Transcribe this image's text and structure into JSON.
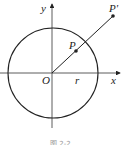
{
  "diagram": {
    "type": "geometry",
    "labels": {
      "y_axis": "y",
      "x_axis": "x",
      "origin": "O",
      "radius": "r",
      "point_inner": "P",
      "point_outer": "P'"
    },
    "caption": "图 2-2",
    "colors": {
      "stroke": "#222222",
      "background": "#ffffff"
    }
  }
}
